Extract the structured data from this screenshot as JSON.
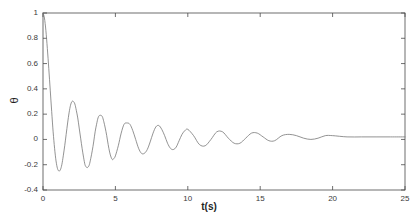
{
  "chart_data": {
    "type": "line",
    "title": "",
    "subtitle": "",
    "xlabel": "t(s)",
    "ylabel": "θ",
    "xlim": [
      0,
      25
    ],
    "ylim": [
      -0.4,
      1.0
    ],
    "xticks": [
      0,
      5,
      10,
      15,
      20,
      25
    ],
    "xtick_labels": [
      "0",
      "5",
      "10",
      "15",
      "20",
      "25"
    ],
    "yticks": [
      1.0,
      0.8,
      0.6,
      0.4,
      0.2,
      0.0,
      -0.2,
      -0.4
    ],
    "ytick_labels": [
      "1",
      "0.8",
      "0.6",
      "0.4",
      "0.2",
      "0",
      "-0.2",
      "-0.4"
    ],
    "grid": false,
    "legend": null,
    "legend_position": "none",
    "line_color": "#777777",
    "line_width": 0.8,
    "axis_color": "#4a4a4a",
    "background_color": "#ffffff",
    "annotations": [],
    "steady_state_value": 0.02,
    "oscillation_period_s": 1.85,
    "series": [
      {
        "name": "theta",
        "x": [
          0,
          0.1,
          0.2,
          0.3,
          0.4,
          0.5,
          0.6,
          0.7,
          0.8,
          0.9,
          1.0,
          1.1,
          1.2,
          1.3,
          1.4,
          1.5,
          1.6,
          1.7,
          1.8,
          1.9,
          2.0,
          2.1,
          2.2,
          2.3,
          2.4,
          2.5,
          2.6,
          2.7,
          2.8,
          2.9,
          3.0,
          3.1,
          3.2,
          3.3,
          3.4,
          3.5,
          3.6,
          3.7,
          3.8,
          3.9,
          4.0,
          4.1,
          4.2,
          4.3,
          4.4,
          4.5,
          4.6,
          4.7,
          4.8,
          4.9,
          5.0,
          5.2,
          5.4,
          5.6,
          5.8,
          6.0,
          6.2,
          6.4,
          6.6,
          6.8,
          7.0,
          7.2,
          7.4,
          7.6,
          7.8,
          8.0,
          8.2,
          8.4,
          8.6,
          8.8,
          9.0,
          9.2,
          9.4,
          9.6,
          9.8,
          10.0,
          10.4,
          10.8,
          11.2,
          11.6,
          12.0,
          12.4,
          12.8,
          13.2,
          13.6,
          14.0,
          14.4,
          14.8,
          15.2,
          15.6,
          16.0,
          16.5,
          17.0,
          17.5,
          18.0,
          18.5,
          19.0,
          19.5,
          20.0,
          21.0,
          22.0,
          23.0,
          24.0,
          25.0
        ],
        "y": [
          1.0,
          0.96,
          0.86,
          0.72,
          0.56,
          0.39,
          0.22,
          0.06,
          -0.07,
          -0.17,
          -0.23,
          -0.25,
          -0.24,
          -0.2,
          -0.13,
          -0.05,
          0.04,
          0.13,
          0.21,
          0.27,
          0.3,
          0.3,
          0.28,
          0.23,
          0.17,
          0.09,
          0.01,
          -0.07,
          -0.14,
          -0.2,
          -0.22,
          -0.22,
          -0.2,
          -0.15,
          -0.09,
          -0.02,
          0.06,
          0.12,
          0.17,
          0.19,
          0.19,
          0.18,
          0.14,
          0.09,
          0.03,
          -0.04,
          -0.1,
          -0.14,
          -0.16,
          -0.15,
          -0.13,
          -0.05,
          0.05,
          0.12,
          0.13,
          0.12,
          0.07,
          0.0,
          -0.07,
          -0.11,
          -0.11,
          -0.08,
          -0.02,
          0.05,
          0.1,
          0.11,
          0.08,
          0.03,
          -0.03,
          -0.07,
          -0.08,
          -0.06,
          -0.01,
          0.04,
          0.07,
          0.08,
          0.03,
          -0.04,
          -0.05,
          0.0,
          0.06,
          0.06,
          0.01,
          -0.03,
          -0.03,
          0.01,
          0.05,
          0.05,
          0.02,
          -0.01,
          -0.01,
          0.03,
          0.04,
          0.03,
          0.01,
          0.0,
          0.01,
          0.03,
          0.03,
          0.02,
          0.02,
          0.02,
          0.02,
          0.02
        ]
      }
    ]
  }
}
